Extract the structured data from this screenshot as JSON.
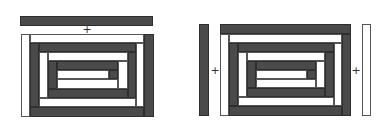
{
  "diagram": {
    "type": "log-cabin spiral strip decomposition",
    "colors": {
      "dark": "#4a4a4a",
      "light": "#ffffff",
      "outline": "#2e2e2e"
    },
    "figures": [
      {
        "id": "left",
        "plus_label": "+",
        "plus_pos": [
          87,
          30
        ],
        "rects": [
          {
            "name": "detached-top-bar",
            "x": 20,
            "y": 16,
            "w": 133,
            "h": 10,
            "fill": "dark"
          },
          {
            "name": "ring1-left",
            "x": 21,
            "y": 34,
            "w": 9,
            "h": 83,
            "fill": "light"
          },
          {
            "name": "ring1-top",
            "x": 30,
            "y": 34,
            "w": 114,
            "h": 9,
            "fill": "light"
          },
          {
            "name": "ring1-right",
            "x": 144,
            "y": 34,
            "w": 10,
            "h": 83,
            "fill": "dark"
          },
          {
            "name": "ring1-bottom",
            "x": 30,
            "y": 107,
            "w": 114,
            "h": 10,
            "fill": "dark"
          },
          {
            "name": "ring2-left",
            "x": 30,
            "y": 43,
            "w": 9,
            "h": 64,
            "fill": "dark"
          },
          {
            "name": "ring2-top",
            "x": 39,
            "y": 43,
            "w": 97,
            "h": 9,
            "fill": "dark"
          },
          {
            "name": "ring2-right",
            "x": 136,
            "y": 43,
            "w": 8,
            "h": 64,
            "fill": "light"
          },
          {
            "name": "ring2-bottom",
            "x": 39,
            "y": 98,
            "w": 97,
            "h": 9,
            "fill": "light"
          },
          {
            "name": "ring3-left",
            "x": 39,
            "y": 52,
            "w": 9,
            "h": 46,
            "fill": "light"
          },
          {
            "name": "ring3-top",
            "x": 48,
            "y": 52,
            "w": 80,
            "h": 9,
            "fill": "light"
          },
          {
            "name": "ring3-right",
            "x": 128,
            "y": 52,
            "w": 8,
            "h": 46,
            "fill": "dark"
          },
          {
            "name": "ring3-bottom",
            "x": 48,
            "y": 89,
            "w": 80,
            "h": 9,
            "fill": "dark"
          },
          {
            "name": "ring4-left",
            "x": 48,
            "y": 61,
            "w": 9,
            "h": 28,
            "fill": "dark"
          },
          {
            "name": "ring4-top",
            "x": 57,
            "y": 61,
            "w": 61,
            "h": 9,
            "fill": "dark"
          },
          {
            "name": "ring4-right",
            "x": 118,
            "y": 61,
            "w": 10,
            "h": 28,
            "fill": "light"
          },
          {
            "name": "ring4-bottom",
            "x": 57,
            "y": 79,
            "w": 61,
            "h": 10,
            "fill": "light"
          },
          {
            "name": "core-bar",
            "x": 57,
            "y": 70,
            "w": 52,
            "h": 9,
            "fill": "light"
          },
          {
            "name": "core-square",
            "x": 109,
            "y": 70,
            "w": 9,
            "h": 9,
            "fill": "dark"
          }
        ]
      },
      {
        "id": "right",
        "plus_labels": [
          "+",
          "+"
        ],
        "plus_positions": [
          [
            215,
            71
          ],
          [
            356,
            71
          ]
        ],
        "rects": [
          {
            "name": "detached-left-bar",
            "x": 199,
            "y": 24,
            "w": 10,
            "h": 92,
            "fill": "dark"
          },
          {
            "name": "detached-right-bar",
            "x": 362,
            "y": 24,
            "w": 9,
            "h": 92,
            "fill": "light"
          },
          {
            "name": "ring1-top",
            "x": 220,
            "y": 24,
            "w": 131,
            "h": 10,
            "fill": "dark"
          },
          {
            "name": "ring1-left",
            "x": 220,
            "y": 34,
            "w": 9,
            "h": 82,
            "fill": "light"
          },
          {
            "name": "ring1-right",
            "x": 342,
            "y": 34,
            "w": 9,
            "h": 82,
            "fill": "dark"
          },
          {
            "name": "ring1-bottom",
            "x": 229,
            "y": 106,
            "w": 113,
            "h": 10,
            "fill": "dark"
          },
          {
            "name": "ring2-top",
            "x": 229,
            "y": 34,
            "w": 113,
            "h": 9,
            "fill": "light"
          },
          {
            "name": "ring2-left",
            "x": 229,
            "y": 43,
            "w": 9,
            "h": 63,
            "fill": "dark"
          },
          {
            "name": "ring2-right",
            "x": 334,
            "y": 43,
            "w": 8,
            "h": 63,
            "fill": "light"
          },
          {
            "name": "ring2-bottom",
            "x": 238,
            "y": 97,
            "w": 96,
            "h": 9,
            "fill": "light"
          },
          {
            "name": "ring3-top",
            "x": 238,
            "y": 43,
            "w": 96,
            "h": 9,
            "fill": "dark"
          },
          {
            "name": "ring3-left",
            "x": 238,
            "y": 52,
            "w": 9,
            "h": 45,
            "fill": "light"
          },
          {
            "name": "ring3-right",
            "x": 325,
            "y": 52,
            "w": 9,
            "h": 45,
            "fill": "dark"
          },
          {
            "name": "ring3-bottom",
            "x": 247,
            "y": 88,
            "w": 78,
            "h": 9,
            "fill": "dark"
          },
          {
            "name": "ring4-top",
            "x": 247,
            "y": 52,
            "w": 78,
            "h": 9,
            "fill": "light"
          },
          {
            "name": "ring4-left",
            "x": 247,
            "y": 61,
            "w": 9,
            "h": 27,
            "fill": "dark"
          },
          {
            "name": "ring4-right",
            "x": 316,
            "y": 61,
            "w": 9,
            "h": 27,
            "fill": "light"
          },
          {
            "name": "ring4-bottom",
            "x": 256,
            "y": 79,
            "w": 60,
            "h": 9,
            "fill": "light"
          },
          {
            "name": "core-top",
            "x": 256,
            "y": 61,
            "w": 60,
            "h": 9,
            "fill": "dark"
          },
          {
            "name": "core-bar",
            "x": 256,
            "y": 70,
            "w": 51,
            "h": 9,
            "fill": "light"
          },
          {
            "name": "core-square",
            "x": 307,
            "y": 70,
            "w": 9,
            "h": 9,
            "fill": "dark"
          }
        ]
      }
    ]
  }
}
